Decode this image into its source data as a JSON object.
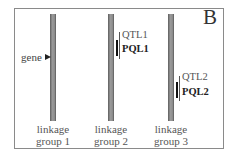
{
  "panel_letter": "B",
  "gene": {
    "label": "gene",
    "linkage_group": 1
  },
  "groups": [
    {
      "line1": "linkage",
      "line2": "group 1"
    },
    {
      "line1": "linkage",
      "line2": "group 2"
    },
    {
      "line1": "linkage",
      "line2": "group 3"
    }
  ],
  "loci": [
    {
      "qtl": "QTL1",
      "pql": "PQL1",
      "linkage_group": 2
    },
    {
      "qtl": "QTL2",
      "pql": "PQL2",
      "linkage_group": 3
    }
  ],
  "colors": {
    "chromosome": "#8c8c8c",
    "frame": "#8a8a8a",
    "pql_bar": "#111111",
    "qtl_bar": "#555555"
  }
}
